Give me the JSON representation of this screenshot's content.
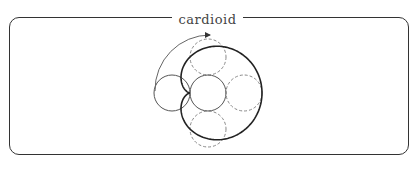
{
  "title": "cardioid",
  "diagram": {
    "fixed_circle": {
      "cx": 208,
      "cy": 93,
      "r": 18,
      "style": "solid"
    },
    "rolling_circles": [
      {
        "cx": 172,
        "cy": 93,
        "r": 18,
        "style": "solid"
      },
      {
        "cx": 208,
        "cy": 57,
        "r": 18,
        "style": "dashed"
      },
      {
        "cx": 244,
        "cy": 93,
        "r": 18,
        "style": "dashed"
      },
      {
        "cx": 208,
        "cy": 129,
        "r": 18,
        "style": "dashed"
      }
    ],
    "curve": "cardioid",
    "arrow": "motion-arc"
  },
  "colors": {
    "frame": "#333333",
    "curve": "#222222",
    "circle": "#555555",
    "dashed": "#888888",
    "arrow": "#666666"
  }
}
